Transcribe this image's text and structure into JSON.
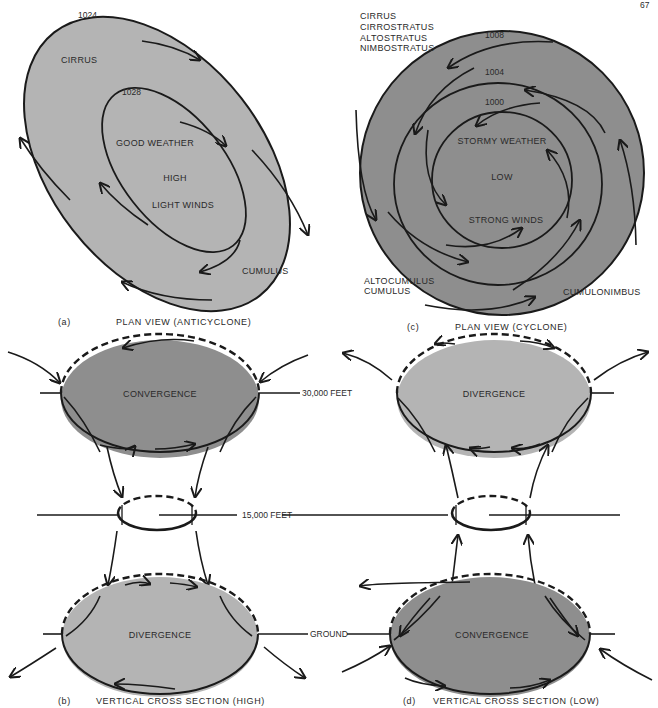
{
  "page_number": "67",
  "colors": {
    "light_fill": "#b4b4b4",
    "dark_fill": "#8e8e8e",
    "line": "#1a1a1a",
    "text": "#2a2a2a",
    "background": "#ffffff"
  },
  "panel_a": {
    "letter": "(a)",
    "caption": "PLAN VIEW (ANTICYCLONE)",
    "isobar_outer": "1024",
    "isobar_inner": "1028",
    "cloud_top": "CIRRUS",
    "cloud_bottom": "CUMULUS",
    "center_lines": [
      "GOOD WEATHER",
      "HIGH",
      "LIGHT WINDS"
    ]
  },
  "panel_c": {
    "letter": "(c)",
    "caption": "PLAN VIEW (CYCLONE)",
    "isobars": [
      "1008",
      "1004",
      "1000"
    ],
    "clouds_top": [
      "CIRRUS",
      "CIRROSTRATUS",
      "ALTOSTRATUS",
      "NIMBOSTRATUS"
    ],
    "clouds_bottom_left": [
      "ALTOCUMULUS",
      "CUMULUS"
    ],
    "cloud_bottom_right": "CUMULONIMBUS",
    "center_lines": [
      "STORMY WEATHER",
      "LOW",
      "STRONG WINDS"
    ]
  },
  "panel_b": {
    "letter": "(b)",
    "caption": "VERTICAL CROSS SECTION (HIGH)",
    "upper_label": "CONVERGENCE",
    "lower_label": "DIVERGENCE"
  },
  "panel_d": {
    "letter": "(d)",
    "caption": "VERTICAL CROSS SECTION (LOW)",
    "upper_label": "DIVERGENCE",
    "lower_label": "CONVERGENCE"
  },
  "levels": {
    "top": "30,000 FEET",
    "middle": "15,000 FEET",
    "ground": "GROUND"
  }
}
